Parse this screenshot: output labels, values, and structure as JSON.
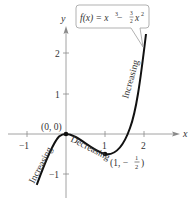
{
  "figure": {
    "function_label": "f(x) = x³ − ³⁄₂x²",
    "function_parts": {
      "lhs": "f(x) = x",
      "exp1": "3",
      "minus": " − ",
      "frac_num": "3",
      "frac_den": "2",
      "x": "x",
      "exp2": "2"
    },
    "axes": {
      "x_label": "x",
      "y_label": "y",
      "x_ticks": [
        "−1",
        "1",
        "2"
      ],
      "y_ticks": [
        "2",
        "1",
        "−1"
      ]
    },
    "points": [
      {
        "label": "(0, 0)",
        "x": 0,
        "y": 0
      },
      {
        "label_prefix": "(1, −",
        "frac_num": "1",
        "frac_den": "2",
        "label_suffix": ")",
        "x": 1,
        "y": -0.5
      }
    ],
    "annotations": {
      "left_increasing": "Increasing",
      "decreasing": "Decreasing",
      "right_increasing": "Increasing"
    },
    "colors": {
      "curve": "#111111",
      "axes": "#8a8a8a",
      "callout_border": "#a8a8a8",
      "text": "#333333"
    }
  }
}
